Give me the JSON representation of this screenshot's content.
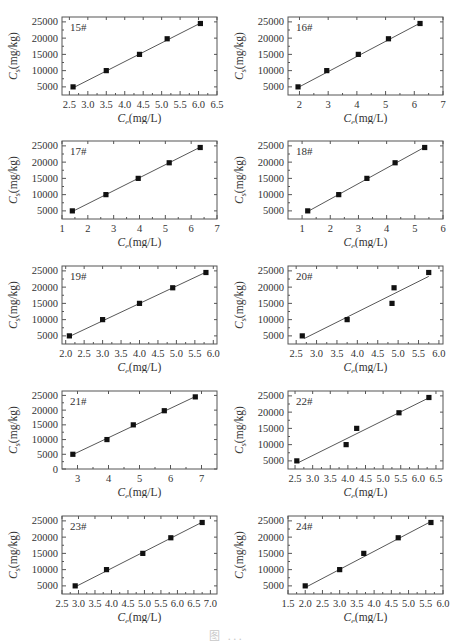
{
  "figure": {
    "caption_partial": "图 ...",
    "layout": {
      "rows": 5,
      "cols": 2
    }
  },
  "chart_data": [
    {
      "id": "15#",
      "type": "scatter",
      "label": "15#",
      "xlabel": "Ce(mg/L)",
      "ylabel": "Cs(mg/kg)",
      "xlim": [
        2.3,
        6.5
      ],
      "ylim": [
        2500,
        26500
      ],
      "xticks": [
        2.5,
        3.0,
        3.5,
        4.0,
        4.5,
        5.0,
        5.5,
        6.0,
        6.5
      ],
      "yticks": [
        5000,
        10000,
        15000,
        20000,
        25000
      ],
      "x": [
        2.6,
        3.5,
        4.4,
        5.15,
        6.05
      ],
      "y": [
        5000,
        10000,
        15000,
        19800,
        24500
      ],
      "fit": {
        "x": [
          2.6,
          6.05
        ],
        "y": [
          4700,
          24600
        ]
      },
      "grid": false,
      "legend": null
    },
    {
      "id": "16#",
      "type": "scatter",
      "label": "16#",
      "xlabel": "Ce(mg/L)",
      "ylabel": "Cs(mg/kg)",
      "xlim": [
        1.6,
        7.0
      ],
      "ylim": [
        2500,
        26500
      ],
      "xticks": [
        2,
        3,
        4,
        5,
        6,
        7
      ],
      "yticks": [
        5000,
        10000,
        15000,
        20000,
        25000
      ],
      "x": [
        1.95,
        2.95,
        4.05,
        5.1,
        6.2
      ],
      "y": [
        5000,
        10000,
        15000,
        19800,
        24500
      ],
      "fit": {
        "x": [
          1.95,
          6.2
        ],
        "y": [
          4800,
          24600
        ]
      },
      "grid": false,
      "legend": null
    },
    {
      "id": "17#",
      "type": "scatter",
      "label": "17#",
      "xlabel": "Ce(mg/L)",
      "ylabel": "Cs(mg/kg)",
      "xlim": [
        1.0,
        7.0
      ],
      "ylim": [
        2500,
        26500
      ],
      "xticks": [
        1,
        2,
        3,
        4,
        5,
        6,
        7
      ],
      "yticks": [
        5000,
        10000,
        15000,
        20000,
        25000
      ],
      "x": [
        1.4,
        2.7,
        3.95,
        5.15,
        6.35
      ],
      "y": [
        5000,
        10000,
        15000,
        19800,
        24500
      ],
      "fit": {
        "x": [
          1.4,
          6.35
        ],
        "y": [
          4800,
          24600
        ]
      },
      "grid": false,
      "legend": null
    },
    {
      "id": "18#",
      "type": "scatter",
      "label": "18#",
      "xlabel": "Ce(mg/L)",
      "ylabel": "Cs(mg/kg)",
      "xlim": [
        0.5,
        6.0
      ],
      "ylim": [
        2500,
        26500
      ],
      "xticks": [
        1,
        2,
        3,
        4,
        5,
        6
      ],
      "yticks": [
        5000,
        10000,
        15000,
        20000,
        25000
      ],
      "x": [
        1.2,
        2.3,
        3.3,
        4.3,
        5.35
      ],
      "y": [
        5000,
        10000,
        15000,
        19800,
        24500
      ],
      "fit": {
        "x": [
          1.2,
          5.35
        ],
        "y": [
          4800,
          24600
        ]
      },
      "grid": false,
      "legend": null
    },
    {
      "id": "19#",
      "type": "scatter",
      "label": "19#",
      "xlabel": "Ce(mg/L)",
      "ylabel": "Cs(mg/kg)",
      "xlim": [
        1.9,
        6.1
      ],
      "ylim": [
        2500,
        26500
      ],
      "xticks": [
        2.0,
        2.5,
        3.0,
        3.5,
        4.0,
        4.5,
        5.0,
        5.5,
        6.0
      ],
      "yticks": [
        5000,
        10000,
        15000,
        20000,
        25000
      ],
      "x": [
        2.1,
        3.0,
        4.0,
        4.9,
        5.8
      ],
      "y": [
        5000,
        10000,
        15000,
        19800,
        24500
      ],
      "fit": {
        "x": [
          2.1,
          5.8
        ],
        "y": [
          4800,
          24600
        ]
      },
      "grid": false,
      "legend": null
    },
    {
      "id": "20#",
      "type": "scatter",
      "label": "20#",
      "xlabel": "Ce(mg/L)",
      "ylabel": "Cs(mg/kg)",
      "xlim": [
        2.3,
        6.1
      ],
      "ylim": [
        2500,
        26500
      ],
      "xticks": [
        2.5,
        3.0,
        3.5,
        4.0,
        4.5,
        5.0,
        5.5,
        6.0
      ],
      "yticks": [
        5000,
        10000,
        15000,
        20000,
        25000
      ],
      "x": [
        2.65,
        3.75,
        4.85,
        4.9,
        5.75
      ],
      "y": [
        5000,
        10000,
        15000,
        19800,
        24500
      ],
      "fit": {
        "x": [
          2.7,
          5.75
        ],
        "y": [
          4200,
          23300
        ]
      },
      "grid": false,
      "legend": null
    },
    {
      "id": "21#",
      "type": "scatter",
      "label": "21#",
      "xlabel": "Ce(mg/L)",
      "ylabel": "Cs(mg/kg)",
      "xlim": [
        2.5,
        7.5
      ],
      "ylim": [
        0,
        26500
      ],
      "xticks": [
        3,
        4,
        5,
        6,
        7
      ],
      "yticks": [
        0,
        5000,
        10000,
        15000,
        20000,
        25000
      ],
      "x": [
        2.85,
        3.95,
        4.8,
        5.8,
        6.8
      ],
      "y": [
        5000,
        10000,
        15000,
        19800,
        24500
      ],
      "fit": {
        "x": [
          2.85,
          6.8
        ],
        "y": [
          4900,
          24600
        ]
      },
      "grid": false,
      "legend": null
    },
    {
      "id": "22#",
      "type": "scatter",
      "label": "22#",
      "xlabel": "Ce(mg/L)",
      "ylabel": "Cs(mg/kg)",
      "xlim": [
        2.3,
        6.7
      ],
      "ylim": [
        2500,
        26500
      ],
      "xticks": [
        2.5,
        3.0,
        3.5,
        4.0,
        4.5,
        5.0,
        5.5,
        6.0,
        6.5
      ],
      "yticks": [
        5000,
        10000,
        15000,
        20000,
        25000
      ],
      "x": [
        2.55,
        3.95,
        4.25,
        5.45,
        6.3
      ],
      "y": [
        5000,
        10000,
        15000,
        19800,
        24500
      ],
      "fit": {
        "x": [
          2.6,
          6.3
        ],
        "y": [
          4500,
          24400
        ]
      },
      "grid": false,
      "legend": null
    },
    {
      "id": "23#",
      "type": "scatter",
      "label": "23#",
      "xlabel": "Ce(mg/L)",
      "ylabel": "Cs(mg/kg)",
      "xlim": [
        2.5,
        7.2
      ],
      "ylim": [
        2500,
        26500
      ],
      "xticks": [
        2.5,
        3.0,
        3.5,
        4.0,
        4.5,
        5.0,
        5.5,
        6.0,
        6.5,
        7.0
      ],
      "yticks": [
        5000,
        10000,
        15000,
        20000,
        25000
      ],
      "x": [
        2.9,
        3.85,
        4.95,
        5.8,
        6.75
      ],
      "y": [
        5000,
        10000,
        15000,
        19800,
        24500
      ],
      "fit": {
        "x": [
          2.9,
          6.75
        ],
        "y": [
          4700,
          24600
        ]
      },
      "grid": false,
      "legend": null
    },
    {
      "id": "24#",
      "type": "scatter",
      "label": "24#",
      "xlabel": "Ce(mg/L)",
      "ylabel": "Cs(mg/kg)",
      "xlim": [
        1.5,
        6.0
      ],
      "ylim": [
        2500,
        26500
      ],
      "xticks": [
        1.5,
        2.0,
        2.5,
        3.0,
        3.5,
        4.0,
        4.5,
        5.0,
        5.5,
        6.0
      ],
      "yticks": [
        5000,
        10000,
        15000,
        20000,
        25000
      ],
      "x": [
        2.0,
        3.0,
        3.7,
        4.7,
        5.65
      ],
      "y": [
        5000,
        10000,
        15000,
        19800,
        24500
      ],
      "fit": {
        "x": [
          2.0,
          5.65
        ],
        "y": [
          4500,
          24800
        ]
      },
      "grid": false,
      "legend": null
    }
  ]
}
